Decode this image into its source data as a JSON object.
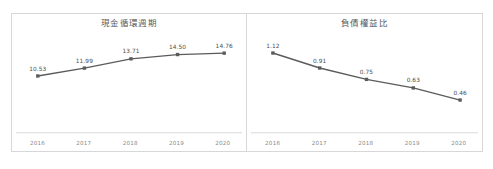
{
  "charts": [
    {
      "id": "cash-conversion-cycle",
      "title": "現金循環週期",
      "categories": [
        "2016",
        "2017",
        "2018",
        "2019",
        "2020"
      ],
      "values": [
        10.53,
        11.99,
        13.71,
        14.5,
        14.76
      ],
      "labels": [
        "10.53",
        "11.99",
        "13.71",
        "14.50",
        "14.76"
      ]
    },
    {
      "id": "debt-to-equity-ratio",
      "title": "負債權益比",
      "categories": [
        "2016",
        "2017",
        "2018",
        "2019",
        "2020"
      ],
      "values": [
        1.12,
        0.91,
        0.75,
        0.63,
        0.46
      ],
      "labels": [
        "1.12",
        "0.91",
        "0.75",
        "0.63",
        "0.46"
      ]
    }
  ],
  "chart_data": [
    {
      "type": "line",
      "title": "現金循環週期",
      "categories": [
        "2016",
        "2017",
        "2018",
        "2019",
        "2020"
      ],
      "values": [
        10.53,
        11.99,
        13.71,
        14.5,
        14.76
      ],
      "xlabel": "",
      "ylabel": "",
      "ylim": [
        0,
        16.5
      ],
      "grid": false,
      "legend": "none",
      "data_labels": true,
      "series_color": "#5b5b5b",
      "marker": "square"
    },
    {
      "type": "line",
      "title": "負債權益比",
      "categories": [
        "2016",
        "2017",
        "2018",
        "2019",
        "2020"
      ],
      "values": [
        1.12,
        0.91,
        0.75,
        0.63,
        0.46
      ],
      "xlabel": "",
      "ylabel": "",
      "ylim": [
        0,
        1.25
      ],
      "grid": false,
      "legend": "none",
      "data_labels": true,
      "series_color": "#5b5b5b",
      "marker": "square"
    }
  ],
  "colors": {
    "frame_border": "#d7d7d7",
    "axis_line": "#d9d9d9",
    "series": "#5b5b5b",
    "title_text": "#595959",
    "tick_text": "#8a8a8a",
    "label_text": "#4d4d4d",
    "background": "#ffffff"
  }
}
